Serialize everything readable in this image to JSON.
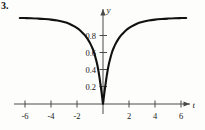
{
  "figure": {
    "problem_number": "3.",
    "background_color": "#fdfdfc",
    "curve_color": "#111111",
    "axis_color": "#4a4a4a"
  },
  "chart_data": {
    "type": "line",
    "title": "",
    "subtitle": "",
    "xlabel": "t",
    "ylabel": "y",
    "grid": false,
    "legend": null,
    "annotations": [],
    "xlim": [
      -6.9,
      7.2
    ],
    "ylim": [
      -0.12,
      1.18
    ],
    "xticks": [
      -6,
      -4,
      -2,
      2,
      4,
      6
    ],
    "xtick_labels": [
      "-6",
      "-4",
      "-2",
      "2",
      "4",
      "6"
    ],
    "yticks": [
      0.2,
      0.4,
      0.6,
      0.8
    ],
    "ytick_labels": [
      "0.2",
      "0.4",
      "0.6",
      "0.8"
    ],
    "series": [
      {
        "name": "y(t)",
        "x": [
          -6.4,
          -6.0,
          -5.5,
          -5.0,
          -4.5,
          -4.0,
          -3.5,
          -3.0,
          -2.6,
          -2.2,
          -1.9,
          -1.6,
          -1.4,
          -1.2,
          -1.0,
          -0.85,
          -0.7,
          -0.55,
          -0.42,
          -0.3,
          -0.2,
          -0.12,
          -0.05,
          0.0,
          0.05,
          0.12,
          0.2,
          0.3,
          0.42,
          0.55,
          0.7,
          0.85,
          1.0,
          1.2,
          1.4,
          1.6,
          1.9,
          2.2,
          2.6,
          3.0,
          3.5,
          4.0,
          4.5,
          5.0,
          5.5,
          6.0,
          6.4
        ],
        "y": [
          1.012,
          1.011,
          1.009,
          1.005,
          1.0,
          0.993,
          0.982,
          0.965,
          0.945,
          0.914,
          0.883,
          0.842,
          0.81,
          0.769,
          0.717,
          0.669,
          0.612,
          0.53,
          0.448,
          0.342,
          0.238,
          0.148,
          0.063,
          0.0,
          0.063,
          0.148,
          0.238,
          0.342,
          0.448,
          0.53,
          0.612,
          0.669,
          0.717,
          0.769,
          0.81,
          0.842,
          0.883,
          0.914,
          0.945,
          0.965,
          0.982,
          0.993,
          1.0,
          1.005,
          1.009,
          1.011,
          1.012
        ]
      }
    ]
  },
  "labels": {
    "y_axis": "y",
    "t_axis": "t"
  }
}
